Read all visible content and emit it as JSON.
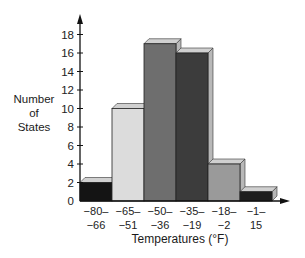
{
  "chart_data": {
    "type": "bar",
    "title": "",
    "xlabel": "Temperatures (°F)",
    "ylabel": "Number of States",
    "ylabel_lines": [
      "Number",
      "of",
      "States"
    ],
    "categories": [
      "−80– −66",
      "−65– −51",
      "−50– −36",
      "−35– −19",
      "−18– −2",
      "−1– 15"
    ],
    "category_lines": [
      [
        "−80–",
        "−66"
      ],
      [
        "−65–",
        "−51"
      ],
      [
        "−50–",
        "−36"
      ],
      [
        "−35–",
        "−19"
      ],
      [
        "−18–",
        "−2"
      ],
      [
        "−1–",
        "15"
      ]
    ],
    "values": [
      2,
      10,
      17,
      16,
      4,
      1
    ],
    "bar_colors": [
      "#141414",
      "#dcdcdc",
      "#6e6e6e",
      "#3c3c3c",
      "#9a9a9a",
      "#1e1e1e"
    ],
    "yticks": [
      0,
      2,
      4,
      6,
      8,
      10,
      12,
      14,
      16,
      18
    ],
    "ylim": [
      0,
      19
    ],
    "grid": false,
    "legend": null
  }
}
